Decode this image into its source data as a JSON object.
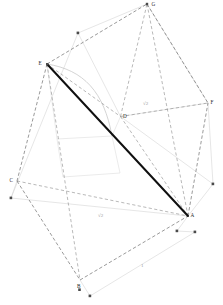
{
  "figure": {
    "type": "geometry-diagram",
    "canvas": {
      "width": 223,
      "height": 305,
      "background": "#ffffff"
    },
    "colors": {
      "solid_edge": "#6e6e6e",
      "dashed_edge": "#8a8a8a",
      "diagonal": "#111111",
      "construction": "#cfcfcf",
      "arc": "#c8c8c8",
      "marker": "#4a4a4a",
      "label": "#2b2b2b",
      "dim_label": "#9a9a9a"
    }
  },
  "vertices": [
    {
      "id": "A",
      "label": "A",
      "x": 188.0,
      "y": 216.0,
      "lx": 190.5,
      "ly": 212.5
    },
    {
      "id": "B",
      "label": "B",
      "x": 80.0,
      "y": 280.0,
      "lx": 77.0,
      "ly": 283.5
    },
    {
      "id": "C",
      "label": "C",
      "x": 17.0,
      "y": 181.0,
      "lx": 9.5,
      "ly": 177.5
    },
    {
      "id": "D",
      "label": "D",
      "x": 120.5,
      "y": 116.5,
      "lx": 123.0,
      "ly": 113.5
    },
    {
      "id": "E",
      "label": "E",
      "x": 47.0,
      "y": 64.0,
      "lx": 38.5,
      "ly": 60.5
    },
    {
      "id": "F",
      "label": "F",
      "x": 208.0,
      "y": 103.0,
      "lx": 210.5,
      "ly": 100.0
    },
    {
      "id": "G",
      "label": "G",
      "x": 147.0,
      "y": 4.0,
      "lx": 151.5,
      "ly": 1.5
    }
  ],
  "markers": [
    {
      "name": "marker-top-left",
      "x": 78.0,
      "y": 33.0
    },
    {
      "name": "marker-right-upper",
      "x": 213.0,
      "y": 184.0
    },
    {
      "name": "marker-left-lower",
      "x": 11.0,
      "y": 198.0
    },
    {
      "name": "marker-a-lower",
      "x": 177.0,
      "y": 231.0
    },
    {
      "name": "marker-a-right",
      "x": 195.0,
      "y": 232.0
    },
    {
      "name": "marker-b-label",
      "x": 79.5,
      "y": 284.0
    },
    {
      "name": "marker-bottom",
      "x": 90.0,
      "y": 296.0
    }
  ],
  "annotations": [
    {
      "id": "dim-diag-upper",
      "text": "√2",
      "x": 143.0,
      "y": 101.0,
      "name": "dimension-label-sqrt2-upper"
    },
    {
      "id": "dim-diag-lower",
      "text": "√2",
      "x": 98.0,
      "y": 213.0,
      "name": "dimension-label-sqrt2-lower"
    },
    {
      "id": "dim-edge",
      "text": "1",
      "x": 141.0,
      "y": 263.0,
      "name": "dimension-label-one"
    }
  ],
  "segments": {
    "diagonal": {
      "from": "E",
      "to": "A",
      "style": "bold-solid",
      "name": "space-diagonal-EA"
    },
    "solid_edges": [
      {
        "from": "E",
        "to": "G"
      },
      {
        "from": "G",
        "to": "F"
      },
      {
        "from": "E",
        "to": "C"
      },
      {
        "from": "C",
        "to": "B"
      },
      {
        "from": "B",
        "to": "A"
      },
      {
        "from": "A",
        "to": "F"
      }
    ],
    "dashed_edges": [
      {
        "from": "E",
        "to": "D"
      },
      {
        "from": "D",
        "to": "G"
      },
      {
        "from": "D",
        "to": "F"
      },
      {
        "from": "D",
        "to": "A"
      },
      {
        "from": "G",
        "to": "A"
      },
      {
        "from": "E",
        "to": "B"
      },
      {
        "from": "C",
        "to": "A"
      }
    ]
  }
}
